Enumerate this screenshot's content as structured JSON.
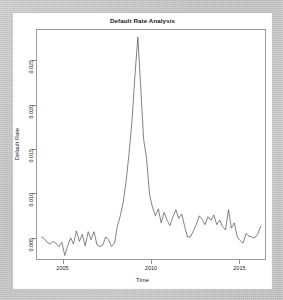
{
  "figure": {
    "title": "Default Rate Analysis",
    "background_color": "#c9c9c9",
    "panel_color": "#ffffff",
    "line_color": "#4d4d4d",
    "axis_color": "#9b9b9b"
  },
  "chart_data": {
    "type": "line",
    "title": "Default Rate Analysis",
    "xlabel": "Time",
    "ylabel": "Default Rate",
    "grid": false,
    "legend": null,
    "xlim": [
      2003.5,
      2016.5
    ],
    "ylim": [
      0.0025,
      0.0285
    ],
    "xticks": [
      2005,
      2010,
      2015
    ],
    "xtick_labels": [
      "2005",
      "2010",
      "2015"
    ],
    "yticks": [
      0.005,
      0.01,
      0.015,
      0.02,
      0.025
    ],
    "ytick_labels": [
      "0.005",
      "0.010",
      "0.015",
      "0.020",
      "0.025"
    ],
    "series": [
      {
        "name": "Default Rate",
        "color": "#4d4d4d",
        "x": [
          2003.75,
          2003.92,
          2004.08,
          2004.25,
          2004.42,
          2004.58,
          2004.75,
          2004.92,
          2005.08,
          2005.25,
          2005.42,
          2005.58,
          2005.75,
          2005.92,
          2006.08,
          2006.25,
          2006.42,
          2006.58,
          2006.75,
          2006.92,
          2007.08,
          2007.25,
          2007.42,
          2007.58,
          2007.75,
          2007.92,
          2008.08,
          2008.25,
          2008.42,
          2008.58,
          2008.75,
          2008.92,
          2009.08,
          2009.25,
          2009.42,
          2009.58,
          2009.75,
          2009.92,
          2010.08,
          2010.25,
          2010.42,
          2010.58,
          2010.75,
          2010.92,
          2011.08,
          2011.25,
          2011.42,
          2011.58,
          2011.75,
          2011.92,
          2012.08,
          2012.25,
          2012.42,
          2012.58,
          2012.75,
          2012.92,
          2013.08,
          2013.25,
          2013.42,
          2013.58,
          2013.75,
          2013.92,
          2014.08,
          2014.25,
          2014.42,
          2014.58,
          2014.75,
          2014.92,
          2015.08,
          2015.25,
          2015.42,
          2015.58,
          2015.75,
          2015.92,
          2016.08,
          2016.25
        ],
        "y": [
          0.005,
          0.0048,
          0.0044,
          0.0042,
          0.0045,
          0.0043,
          0.0039,
          0.0044,
          0.0029,
          0.004,
          0.0049,
          0.0042,
          0.0057,
          0.0045,
          0.0053,
          0.004,
          0.0056,
          0.0047,
          0.0056,
          0.0041,
          0.0039,
          0.0041,
          0.005,
          0.0047,
          0.0039,
          0.0043,
          0.0062,
          0.0074,
          0.009,
          0.0113,
          0.0145,
          0.0183,
          0.0232,
          0.0277,
          0.0218,
          0.0161,
          0.0139,
          0.0098,
          0.0084,
          0.0074,
          0.0082,
          0.0066,
          0.0078,
          0.0069,
          0.0063,
          0.0073,
          0.0081,
          0.0071,
          0.0076,
          0.0062,
          0.005,
          0.005,
          0.0057,
          0.0064,
          0.0074,
          0.007,
          0.0064,
          0.0073,
          0.0069,
          0.0075,
          0.0064,
          0.0069,
          0.0062,
          0.0058,
          0.0081,
          0.006,
          0.0066,
          0.005,
          0.0046,
          0.0043,
          0.0054,
          0.0051,
          0.005,
          0.0049,
          0.0053,
          0.0062
        ]
      }
    ]
  }
}
